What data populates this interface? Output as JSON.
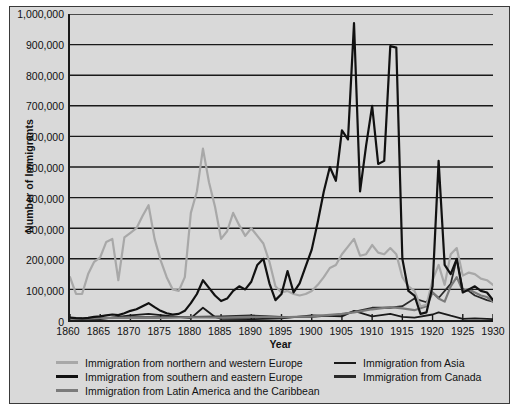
{
  "chart_data": {
    "type": "line",
    "title": "",
    "xlabel": "Year",
    "ylabel": "Number of Immigrants",
    "xlim": [
      1860,
      1930
    ],
    "ylim": [
      0,
      1000000
    ],
    "grid": true,
    "legend_position": "below",
    "xticks": [
      1860,
      1865,
      1870,
      1875,
      1880,
      1885,
      1890,
      1895,
      1900,
      1905,
      1910,
      1915,
      1920,
      1925,
      1930
    ],
    "yticks": [
      0,
      100000,
      200000,
      300000,
      400000,
      500000,
      600000,
      700000,
      800000,
      900000,
      1000000
    ],
    "ytick_labels": [
      "0",
      "100,000",
      "200,000",
      "300,000",
      "400,000",
      "500,000",
      "600,000",
      "700,000",
      "800,000",
      "900,000",
      "1,000,000"
    ],
    "xtick_labels": [
      "1860",
      "1865",
      "1870",
      "1875",
      "1880",
      "1885",
      "1890",
      "1895",
      "1900",
      "1905",
      "1910",
      "1915",
      "1920",
      "1925",
      "1930"
    ],
    "series": [
      {
        "name": "Immigration from northern and western Europe",
        "color": "#a8a8a8",
        "width": 2.2,
        "x": [
          1860,
          1861,
          1862,
          1863,
          1864,
          1865,
          1866,
          1867,
          1868,
          1869,
          1870,
          1871,
          1872,
          1873,
          1874,
          1875,
          1876,
          1877,
          1878,
          1879,
          1880,
          1881,
          1882,
          1883,
          1884,
          1885,
          1886,
          1887,
          1888,
          1889,
          1890,
          1891,
          1892,
          1893,
          1894,
          1895,
          1896,
          1897,
          1898,
          1899,
          1900,
          1901,
          1902,
          1903,
          1904,
          1905,
          1906,
          1907,
          1908,
          1909,
          1910,
          1911,
          1912,
          1913,
          1914,
          1915,
          1916,
          1917,
          1918,
          1919,
          1920,
          1921,
          1922,
          1923,
          1924,
          1925,
          1926,
          1927,
          1928,
          1929,
          1930
        ],
        "y": [
          140000,
          85000,
          85000,
          150000,
          190000,
          205000,
          255000,
          265000,
          130000,
          270000,
          285000,
          300000,
          340000,
          375000,
          265000,
          195000,
          140000,
          100000,
          95000,
          140000,
          350000,
          420000,
          560000,
          450000,
          370000,
          265000,
          290000,
          350000,
          310000,
          275000,
          300000,
          275000,
          250000,
          190000,
          110000,
          90000,
          95000,
          85000,
          80000,
          85000,
          95000,
          115000,
          140000,
          170000,
          180000,
          215000,
          240000,
          265000,
          210000,
          215000,
          245000,
          220000,
          215000,
          235000,
          215000,
          140000,
          110000,
          95000,
          45000,
          50000,
          130000,
          180000,
          115000,
          215000,
          235000,
          145000,
          155000,
          150000,
          135000,
          130000,
          115000
        ]
      },
      {
        "name": "Immigration from southern and eastern Europe",
        "color": "#111111",
        "width": 2.2,
        "x": [
          1860,
          1861,
          1862,
          1863,
          1864,
          1865,
          1866,
          1867,
          1868,
          1869,
          1870,
          1871,
          1872,
          1873,
          1874,
          1875,
          1876,
          1877,
          1878,
          1879,
          1880,
          1881,
          1882,
          1883,
          1884,
          1885,
          1886,
          1887,
          1888,
          1889,
          1890,
          1891,
          1892,
          1893,
          1894,
          1895,
          1896,
          1897,
          1898,
          1899,
          1900,
          1901,
          1902,
          1903,
          1904,
          1905,
          1906,
          1907,
          1908,
          1909,
          1910,
          1911,
          1912,
          1913,
          1914,
          1915,
          1916,
          1917,
          1918,
          1919,
          1920,
          1921,
          1922,
          1923,
          1924,
          1925,
          1926,
          1927,
          1928,
          1929,
          1930
        ],
        "y": [
          8000,
          6000,
          5000,
          7000,
          10000,
          12000,
          15000,
          18000,
          16000,
          22000,
          30000,
          35000,
          45000,
          55000,
          42000,
          30000,
          22000,
          18000,
          20000,
          30000,
          55000,
          85000,
          130000,
          105000,
          80000,
          62000,
          70000,
          95000,
          110000,
          100000,
          125000,
          180000,
          200000,
          120000,
          65000,
          85000,
          160000,
          90000,
          120000,
          175000,
          230000,
          320000,
          420000,
          500000,
          455000,
          620000,
          590000,
          970000,
          420000,
          570000,
          700000,
          510000,
          520000,
          895000,
          890000,
          200000,
          95000,
          80000,
          20000,
          25000,
          110000,
          520000,
          180000,
          150000,
          200000,
          90000,
          100000,
          110000,
          95000,
          90000,
          65000
        ]
      },
      {
        "name": "Immigration from Latin America and the Caribbean",
        "color": "#7b7b7b",
        "width": 2.2,
        "x": [
          1860,
          1865,
          1870,
          1875,
          1880,
          1885,
          1890,
          1895,
          1900,
          1905,
          1907,
          1910,
          1913,
          1915,
          1917,
          1919,
          1920,
          1921,
          1922,
          1923,
          1924,
          1925,
          1926,
          1927,
          1928,
          1929,
          1930
        ],
        "y": [
          5000,
          6000,
          8000,
          7000,
          9000,
          8000,
          10000,
          9000,
          12000,
          20000,
          25000,
          35000,
          42000,
          38000,
          32000,
          45000,
          90000,
          70000,
          60000,
          110000,
          140000,
          95000,
          100000,
          90000,
          80000,
          75000,
          60000
        ]
      },
      {
        "name": "Immigration from Asia",
        "color": "#1a1a1a",
        "width": 1.8,
        "x": [
          1860,
          1865,
          1870,
          1873,
          1875,
          1880,
          1882,
          1884,
          1885,
          1890,
          1895,
          1900,
          1905,
          1907,
          1910,
          1913,
          1915,
          1917,
          1920,
          1921,
          1923,
          1925,
          1927,
          1929,
          1930
        ],
        "y": [
          5000,
          3000,
          15000,
          20000,
          16000,
          6000,
          40000,
          10000,
          4000,
          3000,
          5000,
          15000,
          12000,
          30000,
          12000,
          20000,
          10000,
          8000,
          18000,
          25000,
          14000,
          4000,
          5000,
          4000,
          3000
        ]
      },
      {
        "name": "Immigration from Canada",
        "color": "#2a2a2a",
        "width": 1.8,
        "x": [
          1860,
          1865,
          1870,
          1875,
          1880,
          1885,
          1890,
          1895,
          1900,
          1905,
          1910,
          1913,
          1915,
          1917,
          1919,
          1920,
          1921,
          1923,
          1924,
          1925,
          1926,
          1927,
          1929,
          1930
        ],
        "y": [
          5000,
          6000,
          9000,
          9000,
          10000,
          12000,
          15000,
          10000,
          10000,
          18000,
          40000,
          40000,
          45000,
          70000,
          58000,
          90000,
          72000,
          118000,
          200000,
          100000,
          95000,
          80000,
          65000,
          60000
        ]
      }
    ]
  },
  "axes": {
    "ylabel": "Number of Immigrants",
    "xlabel": "Year"
  },
  "legend": {
    "left_column": [
      {
        "label": "Immigration from northern and western Europe",
        "color": "#a8a8a8",
        "thickness": "3px"
      },
      {
        "label": "Immigration from southern and eastern Europe",
        "color": "#111111",
        "thickness": "3px"
      },
      {
        "label": "Immigration from Latin America and the Caribbean",
        "color": "#7b7b7b",
        "thickness": "3px"
      }
    ],
    "right_column": [
      {
        "label": "Immigration from Asia",
        "color": "#1a1a1a",
        "thickness": "2px"
      },
      {
        "label": "Immigration from Canada",
        "color": "#2a2a2a",
        "thickness": "3px"
      }
    ]
  },
  "colors": {
    "figure_background": "#ffffff",
    "panel_background": "#d9d9d9",
    "frame": "#3a3a3a",
    "axis": "#1a1a1a",
    "grid": "#1a1a1a",
    "text": "#111111"
  }
}
